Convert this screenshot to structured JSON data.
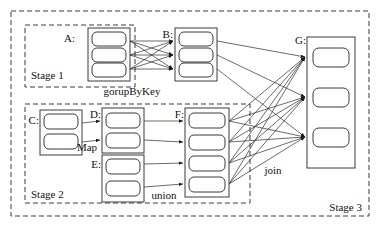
{
  "figure": {
    "caption": "",
    "background": "#ffffff",
    "line_color": "#2b2b2b",
    "box_color": "#3a3a3a"
  },
  "stages": [
    {
      "id": "stage1",
      "label": "Stage 1",
      "x": 25,
      "y": 25,
      "w": 110,
      "h": 62
    },
    {
      "id": "stage2",
      "label": "Stage 2",
      "x": 25,
      "y": 104,
      "w": 225,
      "h": 99
    },
    {
      "id": "stage3",
      "label": "Stage 3",
      "x": 11,
      "y": 11,
      "w": 358,
      "h": 205
    }
  ],
  "stage_labels": [
    {
      "text": "Stage 1",
      "x": 31,
      "y": 79
    },
    {
      "text": "Stage 2",
      "x": 31,
      "y": 197
    },
    {
      "text": "Stage 3",
      "x": 330,
      "y": 210
    }
  ],
  "rdds": [
    {
      "id": "A",
      "label": "A:",
      "label_x": 81,
      "label_y": 42,
      "x": 88,
      "y": 28,
      "w": 42,
      "h": 53,
      "partitions": 3
    },
    {
      "id": "B",
      "label": "B:",
      "label_x": 167,
      "label_y": 42,
      "x": 175,
      "y": 28,
      "w": 42,
      "h": 53,
      "partitions": 3
    },
    {
      "id": "C",
      "label": "C:",
      "label_x": 33,
      "label_y": 124,
      "x": 40,
      "y": 113,
      "w": 42,
      "h": 39,
      "partitions": 2
    },
    {
      "id": "D",
      "label": "D:",
      "label_x": 93,
      "label_y": 122,
      "x": 102,
      "y": 111,
      "w": 42,
      "h": 39,
      "partitions": 2
    },
    {
      "id": "E",
      "label": "E:",
      "label_x": 93,
      "label_y": 163,
      "x": 102,
      "y": 153,
      "w": 42,
      "h": 42,
      "partitions": 2
    },
    {
      "id": "F",
      "label": "F:",
      "label_x": 177,
      "label_y": 117,
      "x": 185,
      "y": 110,
      "w": 44,
      "h": 86,
      "partitions": 4
    },
    {
      "id": "G",
      "label": "G:",
      "label_x": 292,
      "label_y": 47,
      "x": 307,
      "y": 37,
      "w": 48,
      "h": 131,
      "partitions": 3
    }
  ],
  "operations": [
    {
      "name": "gorupByKey",
      "x": 132,
      "y": 92
    },
    {
      "name": "Map",
      "x": 83,
      "y": 149
    },
    {
      "name": "union",
      "x": 155,
      "y": 196
    },
    {
      "name": "join",
      "x": 268,
      "y": 172
    }
  ],
  "edges": {
    "a_to_b": "A partitions fully shuffled to B partitions (groupByKey)",
    "c_to_d": "C partitions mapped one-to-one to D partitions (Map)",
    "d_e_to_f": "D and E partitions unioned into F partitions (union)",
    "b_f_to_g": "B and F partitions joined into G partitions (join)"
  },
  "counts": {
    "A": 3,
    "B": 3,
    "C": 2,
    "D": 2,
    "E": 2,
    "F": 4,
    "G": 3
  }
}
